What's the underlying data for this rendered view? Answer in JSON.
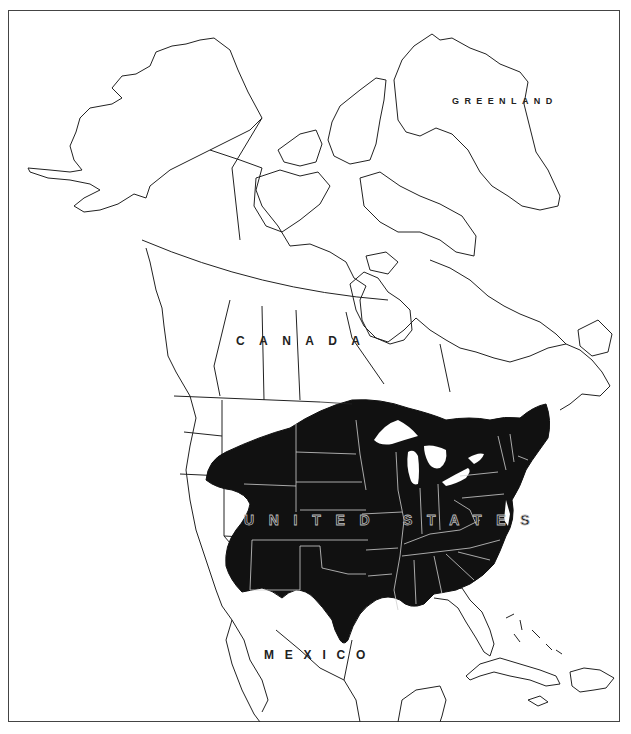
{
  "map": {
    "title": "",
    "type": "range map",
    "region": "North America",
    "fill_color": "#111111",
    "outline_color": "#222222",
    "background": "#ffffff",
    "labels": {
      "greenland": "GREENLAND",
      "canada": "CANADA",
      "united_states": "UNITED STATES",
      "mexico": "MEXICO"
    },
    "shaded_range": "Central and eastern United States (Great Plains to Atlantic coast, south to Texas and the Gulf coast, north into southern prairie Canada)"
  }
}
